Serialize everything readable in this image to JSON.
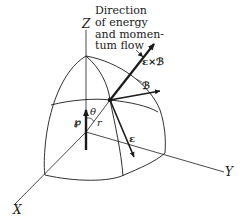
{
  "caption": {
    "lines": [
      "Direction",
      "of energy",
      "and momen-",
      "tum flow"
    ]
  },
  "axes": {
    "x": "X",
    "y": "Y",
    "z": "Z"
  },
  "vectors": {
    "poynting": "ε×ℬ",
    "magnetic": "ℬ",
    "electric": "ε",
    "dipole": "℘"
  },
  "symbols": {
    "theta": "θ",
    "r": "r"
  },
  "colors": {
    "ink": "#1a1a1a",
    "background": "#ffffff"
  }
}
